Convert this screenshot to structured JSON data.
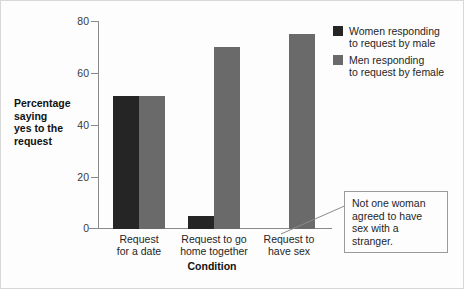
{
  "chart_data": {
    "type": "bar",
    "title": "",
    "subtitle": "",
    "xlabel": "Condition",
    "ylabel": "Percentage saying yes to the request",
    "ylim": [
      0,
      80
    ],
    "yticks": [
      0,
      20,
      40,
      60,
      80
    ],
    "ytick_labels": [
      "0",
      "20",
      "40",
      "60",
      "80"
    ],
    "grid": false,
    "legend_position": "right-top",
    "categories": [
      "Request for a date",
      "Request to go home together",
      "Request to have sex"
    ],
    "series": [
      {
        "name": "Women responding to request by male",
        "color": "#252525",
        "values": [
          51,
          5,
          0
        ]
      },
      {
        "name": "Men responding to request by female",
        "color": "#6a6a6a",
        "values": [
          51,
          70,
          75
        ]
      }
    ],
    "annotations": [
      {
        "text": "Not one woman agreed to have sex with a stranger.",
        "points_to": "Request to have sex / women series (value 0)"
      }
    ]
  },
  "axes": {
    "y_title_line_1": "Percentage",
    "y_title_line_2": "saying",
    "y_title_line_3": "yes to the",
    "y_title_line_4": "request",
    "x_title": "Condition",
    "ytick_0": "0",
    "ytick_1": "20",
    "ytick_2": "40",
    "ytick_3": "60",
    "ytick_4": "80"
  },
  "categories_display": [
    {
      "line1": "Request",
      "line2": "for a date"
    },
    {
      "line1": "Request to go",
      "line2": "home together"
    },
    {
      "line1": "Request to",
      "line2": "have sex"
    }
  ],
  "legend": {
    "entries": [
      {
        "line1": "Women responding",
        "line2": "to request by male",
        "color": "#252525"
      },
      {
        "line1": "Men responding",
        "line2": "to request by female",
        "color": "#6a6a6a"
      }
    ]
  },
  "annotation": {
    "line1": "Not one woman",
    "line2": "agreed to have",
    "line3": "sex with a stranger."
  }
}
